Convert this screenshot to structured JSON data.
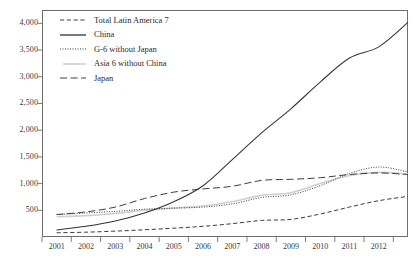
{
  "chart_data": {
    "type": "line",
    "title": "",
    "subtitle": "",
    "xlabel": "",
    "ylabel": "",
    "xlim": [
      2000.5,
      2013.0
    ],
    "ylim": [
      0,
      4250
    ],
    "grid": false,
    "legend_position": "top-left",
    "y_ticks": [
      500,
      1000,
      1500,
      2000,
      2500,
      3000,
      3500,
      4000
    ],
    "y_tick_labels": [
      "500",
      "1,000",
      "1,500",
      "2,000",
      "2,500",
      "3,000",
      "3,500",
      "4,000"
    ],
    "x_ticks": [
      2001,
      2002,
      2003,
      2004,
      2005,
      2006,
      2007,
      2008,
      2009,
      2010,
      2011,
      2012
    ],
    "x_tick_labels": [
      "2001",
      "2002",
      "2003",
      "2004",
      "2005",
      "2006",
      "2007",
      "2008",
      "2009",
      "2010",
      "2011",
      "2012"
    ],
    "x": [
      2001,
      2002,
      2003,
      2004,
      2005,
      2006,
      2007,
      2008,
      2009,
      2010,
      2011,
      2012,
      2013
    ],
    "series": [
      {
        "name": "Total Latin America 7",
        "style": "dashed",
        "color": "#333333",
        "values": [
          80,
          90,
          110,
          135,
          165,
          200,
          250,
          310,
          330,
          430,
          560,
          680,
          760
        ]
      },
      {
        "name": "China",
        "style": "solid",
        "color": "#333333",
        "values": [
          130,
          200,
          300,
          450,
          660,
          960,
          1450,
          1950,
          2400,
          2900,
          3350,
          3560,
          4020
        ]
      },
      {
        "name": "G-6 without Japan",
        "style": "dotted",
        "color": "#333333",
        "values": [
          420,
          450,
          480,
          520,
          540,
          560,
          620,
          740,
          790,
          960,
          1190,
          1310,
          1220
        ]
      },
      {
        "name": "Asia 6 without China",
        "style": "solid-light",
        "color": "#c9c9c9",
        "values": [
          380,
          400,
          440,
          500,
          540,
          580,
          660,
          780,
          830,
          1000,
          1150,
          1210,
          1180
        ]
      },
      {
        "name": "Japan",
        "style": "long-dashed",
        "color": "#333333",
        "values": [
          420,
          470,
          560,
          720,
          840,
          900,
          950,
          1060,
          1080,
          1110,
          1170,
          1200,
          1170
        ]
      }
    ]
  },
  "legend": {
    "items": [
      {
        "label": "Total Latin America 7"
      },
      {
        "label": "China"
      },
      {
        "label": "G-6 without Japan"
      },
      {
        "label": "Asia 6 without China"
      },
      {
        "label": "Japan"
      }
    ]
  }
}
